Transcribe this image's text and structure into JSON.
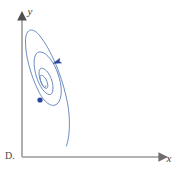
{
  "figure": {
    "choice_label": "D.",
    "background_color": "#ffffff",
    "width": 179,
    "height": 170
  },
  "axes": {
    "x_axis": {
      "label": "x",
      "color": "#9a9a9a",
      "start": [
        22,
        157
      ],
      "end": [
        165,
        157
      ],
      "arrowhead": "right",
      "label_position": [
        169,
        161
      ]
    },
    "y_axis": {
      "label": "y",
      "color": "#9a9a9a",
      "start": [
        22,
        157
      ],
      "end": [
        22,
        14
      ],
      "arrowhead": "up",
      "label_position": [
        29,
        13
      ]
    }
  },
  "chart_data": {
    "type": "line",
    "title": "",
    "subtitle": "",
    "xlabel": "x",
    "ylabel": "y",
    "grid": false,
    "legend": null,
    "curve_name": "inward-spiral-trajectory",
    "curve_description": "Stable spiral sink: trajectory winds counterclockwise inward toward an equilibrium point",
    "curve_color": "#5c7fba",
    "curve_width": 0.9,
    "equilibrium_point": {
      "x": 40,
      "y": 100,
      "color": "#27479c",
      "radius": 2.6
    },
    "direction_arrow": {
      "x": 57,
      "y": 62,
      "angle_deg": -110,
      "color": "#27479c",
      "meaning": "flow direction inward / counterclockwise"
    },
    "spiral_bounds": {
      "x_min": 27,
      "x_max": 67,
      "y_min": 30,
      "y_max": 146
    },
    "spiral_path": "M 66.5 146 C 71 132 70 112 66 96 C 61 74 51 50 40 36 C 33 27 26 28 25.5 40 C 25 55 31 76 38 90 C 44 103 52 108 57 104 C 63 99 62 85 58 74 C 54 62 47 53 41 52 C 35.5 51 33 58 34.5 68 C 36 79 41 89 46 93 C 50.5 96.5 53 94 53 88 C 53 81 49.5 73 45 69.5 C 41.5 66.8 39 68.5 39 73 C 39 78 41.5 84 44 87 C 46 89.5 47.8 88.6 47.8 85.4 C 47.8 81.8 45.5 77.5 43 75.8 C 41 74.4 39.8 75.4 40 78 C 40.3 81.5 42 85.2 43.7 87 C 44.9 88.2 45.9 87.6 45.9 85.8",
    "loop_count": 4,
    "series": [
      {
        "name": "trajectory",
        "points_description": "Parametric logarithmic-spiral style trajectory converging to equilibrium"
      }
    ]
  }
}
